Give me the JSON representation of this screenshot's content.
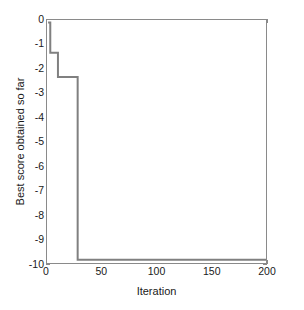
{
  "chart_data": {
    "type": "line",
    "title": "",
    "xlabel": "Iteration",
    "ylabel": "Best score obtained so far",
    "xlim": [
      0,
      200
    ],
    "ylim": [
      -10,
      0
    ],
    "xticks": [
      0,
      50,
      100,
      150,
      200
    ],
    "xticklabels": [
      "0",
      "50",
      "100",
      "150",
      "200"
    ],
    "yticks": [
      0,
      -1,
      -2,
      -3,
      -4,
      -5,
      -6,
      -7,
      -8,
      -9,
      -10
    ],
    "yticklabels": [
      "0",
      "-1",
      "-2",
      "-3",
      "-4",
      "-5",
      "-6",
      "-7",
      "-8",
      "-9",
      "-10"
    ],
    "grid": false,
    "legend": false,
    "legend_position": "none",
    "line_color": "#808080",
    "line_width": 2,
    "drawstyle": "steps-post",
    "series": [
      {
        "name": "Best score obtained so far",
        "x": [
          1,
          3,
          10,
          28,
          200
        ],
        "values": [
          -0.1,
          -1.35,
          -2.35,
          -9.87,
          -9.87
        ]
      }
    ],
    "annotations": []
  },
  "axes": {
    "x_title": "Iteration",
    "y_title": "Best score obtained so far"
  }
}
